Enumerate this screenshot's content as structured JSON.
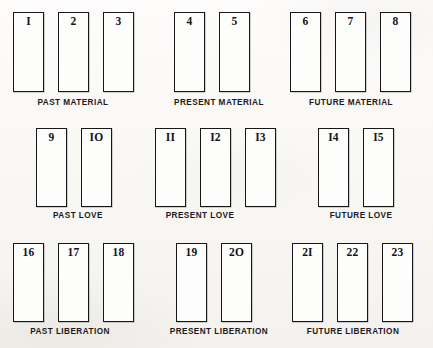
{
  "diagram": {
    "card_count": 23,
    "ink_color": "#17161a",
    "paper_color": "#fbfaf8"
  },
  "rows": [
    {
      "name": "material",
      "groups": [
        {
          "label": "PAST MATERIAL",
          "label_x": 13,
          "label_y": 99,
          "label_width": 120,
          "cards": [
            {
              "number": "I",
              "x": 13,
              "y": 12,
              "w": 31,
              "h": 80
            },
            {
              "number": "2",
              "x": 58,
              "y": 12,
              "w": 31,
              "h": 80
            },
            {
              "number": "3",
              "x": 103,
              "y": 12,
              "w": 31,
              "h": 80
            }
          ]
        },
        {
          "label": "PRESENT MATERIAL",
          "label_x": 159,
          "label_y": 99,
          "label_width": 120,
          "cards": [
            {
              "number": "4",
              "x": 174,
              "y": 12,
              "w": 31,
              "h": 80
            },
            {
              "number": "5",
              "x": 219,
              "y": 12,
              "w": 31,
              "h": 80
            }
          ]
        },
        {
          "label": "FUTURE MATERIAL",
          "label_x": 291,
          "label_y": 99,
          "label_width": 120,
          "cards": [
            {
              "number": "6",
              "x": 290,
              "y": 12,
              "w": 31,
              "h": 80
            },
            {
              "number": "7",
              "x": 335,
              "y": 12,
              "w": 31,
              "h": 80
            },
            {
              "number": "8",
              "x": 380,
              "y": 12,
              "w": 31,
              "h": 80
            }
          ]
        }
      ]
    },
    {
      "name": "love",
      "groups": [
        {
          "label": "PAST LOVE",
          "label_x": 18,
          "label_y": 212,
          "label_width": 120,
          "cards": [
            {
              "number": "9",
              "x": 36,
              "y": 128,
              "w": 31,
              "h": 79
            },
            {
              "number": "IO",
              "x": 81,
              "y": 128,
              "w": 31,
              "h": 79
            }
          ]
        },
        {
          "label": "PRESENT LOVE",
          "label_x": 140,
          "label_y": 212,
          "label_width": 120,
          "cards": [
            {
              "number": "II",
              "x": 155,
              "y": 128,
              "w": 31,
              "h": 79
            },
            {
              "number": "I2",
              "x": 200,
              "y": 128,
              "w": 31,
              "h": 79
            },
            {
              "number": "I3",
              "x": 245,
              "y": 128,
              "w": 31,
              "h": 79
            }
          ]
        },
        {
          "label": "FUTURE LOVE",
          "label_x": 301,
          "label_y": 212,
          "label_width": 120,
          "cards": [
            {
              "number": "I4",
              "x": 318,
              "y": 128,
              "w": 31,
              "h": 79
            },
            {
              "number": "I5",
              "x": 363,
              "y": 128,
              "w": 31,
              "h": 79
            }
          ]
        }
      ]
    },
    {
      "name": "liberation",
      "groups": [
        {
          "label": "PAST LIBERATION",
          "label_x": 10,
          "label_y": 328,
          "label_width": 120,
          "cards": [
            {
              "number": "16",
              "x": 13,
              "y": 243,
              "w": 31,
              "h": 79
            },
            {
              "number": "17",
              "x": 58,
              "y": 243,
              "w": 31,
              "h": 79
            },
            {
              "number": "18",
              "x": 103,
              "y": 243,
              "w": 31,
              "h": 79
            }
          ]
        },
        {
          "label": "PRESENT LIBERATION",
          "label_x": 159,
          "label_y": 328,
          "label_width": 120,
          "cards": [
            {
              "number": "19",
              "x": 176,
              "y": 243,
              "w": 31,
              "h": 79
            },
            {
              "number": "2O",
              "x": 221,
              "y": 243,
              "w": 31,
              "h": 79
            }
          ]
        },
        {
          "label": "FUTURE LIBERATION",
          "label_x": 293,
          "label_y": 328,
          "label_width": 120,
          "cards": [
            {
              "number": "2I",
              "x": 292,
              "y": 243,
              "w": 31,
              "h": 79
            },
            {
              "number": "22",
              "x": 337,
              "y": 243,
              "w": 31,
              "h": 79
            },
            {
              "number": "23",
              "x": 382,
              "y": 243,
              "w": 31,
              "h": 79
            }
          ]
        }
      ]
    }
  ]
}
